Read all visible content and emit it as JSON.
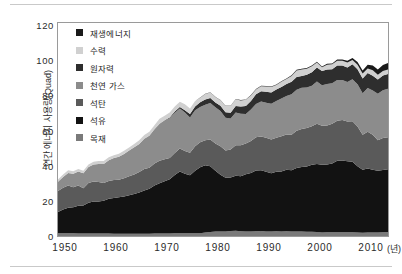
{
  "chart_data": {
    "type": "area",
    "stacked": true,
    "title": "",
    "xlabel": "년",
    "ylabel": "연간 에너지 사용량(Quad)",
    "xlim": [
      1949,
      2014
    ],
    "ylim": [
      0,
      120
    ],
    "yticks": [
      120,
      100,
      80,
      60,
      40,
      20,
      0
    ],
    "xticks": [
      1950,
      1960,
      1970,
      1980,
      1990,
      2000,
      2010
    ],
    "grid": false,
    "legend_position": "inside-top-left",
    "legend_order_top_to_bottom": [
      "재생에너지",
      "수력",
      "원자력",
      "천연 가스",
      "석탄",
      "석유",
      "목재"
    ],
    "stack_order_bottom_to_top": [
      "목재",
      "석유",
      "석탄",
      "천연 가스",
      "원자력",
      "수력",
      "재생에너지"
    ],
    "colors": {
      "재생에너지": "#1a1a1a",
      "수력": "#d0d0d0",
      "원자력": "#2e2e2e",
      "천연 가스": "#8c8c8c",
      "석탄": "#5a5a5a",
      "석유": "#121212",
      "목재": "#7a7a7a"
    },
    "x": [
      1949,
      1950,
      1951,
      1952,
      1953,
      1954,
      1955,
      1956,
      1957,
      1958,
      1959,
      1960,
      1961,
      1962,
      1963,
      1964,
      1965,
      1966,
      1967,
      1968,
      1969,
      1970,
      1971,
      1972,
      1973,
      1974,
      1975,
      1976,
      1977,
      1978,
      1979,
      1980,
      1981,
      1982,
      1983,
      1984,
      1985,
      1986,
      1987,
      1988,
      1989,
      1990,
      1991,
      1992,
      1993,
      1994,
      1995,
      1996,
      1997,
      1998,
      1999,
      2000,
      2001,
      2002,
      2003,
      2004,
      2005,
      2006,
      2007,
      2008,
      2009,
      2010,
      2011,
      2012,
      2013,
      2014
    ],
    "series": [
      {
        "name": "목재",
        "values": [
          1.6,
          1.6,
          1.5,
          1.5,
          1.4,
          1.4,
          1.4,
          1.4,
          1.4,
          1.4,
          1.4,
          1.3,
          1.3,
          1.3,
          1.3,
          1.3,
          1.3,
          1.3,
          1.3,
          1.4,
          1.4,
          1.4,
          1.4,
          1.5,
          1.5,
          1.5,
          1.5,
          1.6,
          1.6,
          2.0,
          2.2,
          2.5,
          2.6,
          2.6,
          2.8,
          2.9,
          2.7,
          2.6,
          2.6,
          2.7,
          2.8,
          2.6,
          2.6,
          2.7,
          2.6,
          2.7,
          2.6,
          2.6,
          2.6,
          2.4,
          2.4,
          2.3,
          2.0,
          2.1,
          2.1,
          2.1,
          2.1,
          2.1,
          2.1,
          2.0,
          1.9,
          2.0,
          2.0,
          2.0,
          2.1,
          2.2
        ]
      },
      {
        "name": "석유",
        "values": [
          11.9,
          13.3,
          14.4,
          14.7,
          15.6,
          15.8,
          17.3,
          18.0,
          18.0,
          18.5,
          19.6,
          20.1,
          20.5,
          21.0,
          21.7,
          22.3,
          23.2,
          24.4,
          25.3,
          27.0,
          28.3,
          29.5,
          30.6,
          32.9,
          34.8,
          33.5,
          32.7,
          35.2,
          37.1,
          37.9,
          37.1,
          34.2,
          31.9,
          30.2,
          30.1,
          31.1,
          30.9,
          32.2,
          32.9,
          34.2,
          34.2,
          33.6,
          32.8,
          33.5,
          33.8,
          34.6,
          34.4,
          35.7,
          36.3,
          36.8,
          37.8,
          38.3,
          38.2,
          38.2,
          38.8,
          40.3,
          40.4,
          40.0,
          39.8,
          37.3,
          35.4,
          36.0,
          35.3,
          34.7,
          35.1,
          35.4
        ]
      },
      {
        "name": "석탄",
        "values": [
          11.9,
          12.3,
          12.6,
          11.3,
          11.4,
          9.7,
          11.2,
          11.3,
          11.0,
          10.0,
          10.0,
          10.1,
          9.9,
          10.2,
          10.7,
          11.1,
          11.6,
          12.0,
          11.9,
          12.4,
          12.7,
          12.3,
          11.9,
          12.4,
          13.0,
          12.9,
          12.7,
          13.7,
          14.1,
          14.0,
          15.0,
          15.4,
          16.0,
          15.3,
          15.9,
          17.1,
          17.5,
          17.3,
          18.0,
          18.8,
          19.1,
          19.2,
          19.0,
          19.1,
          19.8,
          19.9,
          20.1,
          21.0,
          21.4,
          21.7,
          21.6,
          22.6,
          21.9,
          21.9,
          22.3,
          22.5,
          22.8,
          22.4,
          22.7,
          22.4,
          19.7,
          20.8,
          19.7,
          17.3,
          18.0,
          18.0
        ]
      },
      {
        "name": "천연 가스",
        "values": [
          5.1,
          6.0,
          7.0,
          7.5,
          8.0,
          8.5,
          9.0,
          9.6,
          10.2,
          10.7,
          11.7,
          12.4,
          12.9,
          13.7,
          14.4,
          15.3,
          15.8,
          17.0,
          17.9,
          19.2,
          20.7,
          21.8,
          22.5,
          22.7,
          22.5,
          21.7,
          19.9,
          20.3,
          19.9,
          20.0,
          20.7,
          20.4,
          19.9,
          18.5,
          17.4,
          18.5,
          17.8,
          16.7,
          17.7,
          18.6,
          19.7,
          19.7,
          20.1,
          20.7,
          21.3,
          21.7,
          22.7,
          23.1,
          23.2,
          22.8,
          22.9,
          23.8,
          22.8,
          23.5,
          22.8,
          23.0,
          22.6,
          22.2,
          23.7,
          23.8,
          23.4,
          24.6,
          25.0,
          26.1,
          26.9,
          27.4
        ]
      },
      {
        "name": "원자력",
        "values": [
          0.0,
          0.0,
          0.0,
          0.0,
          0.0,
          0.0,
          0.0,
          0.0,
          0.0,
          0.0,
          0.0,
          0.0,
          0.0,
          0.0,
          0.0,
          0.0,
          0.0,
          0.1,
          0.1,
          0.1,
          0.2,
          0.2,
          0.4,
          0.6,
          0.9,
          1.3,
          1.9,
          2.1,
          2.7,
          3.0,
          2.8,
          2.7,
          3.0,
          3.1,
          3.2,
          3.6,
          4.1,
          4.5,
          4.9,
          5.6,
          5.7,
          6.1,
          6.4,
          6.5,
          6.5,
          6.8,
          7.1,
          7.2,
          6.7,
          7.2,
          7.6,
          7.9,
          8.0,
          8.1,
          7.9,
          8.2,
          8.2,
          8.2,
          8.5,
          8.5,
          8.4,
          8.4,
          8.3,
          8.1,
          8.3,
          8.3
        ]
      },
      {
        "name": "수력",
        "values": [
          1.4,
          1.4,
          1.5,
          1.5,
          1.4,
          1.4,
          1.4,
          1.5,
          1.6,
          1.6,
          1.6,
          1.6,
          1.7,
          1.8,
          1.8,
          1.9,
          2.1,
          2.1,
          2.3,
          2.3,
          2.7,
          2.6,
          2.8,
          2.9,
          3.0,
          3.3,
          3.2,
          3.1,
          2.5,
          3.1,
          3.1,
          3.1,
          3.1,
          3.6,
          3.9,
          3.8,
          3.4,
          3.4,
          3.1,
          2.7,
          2.9,
          3.0,
          3.0,
          2.6,
          2.9,
          2.7,
          3.2,
          3.6,
          3.6,
          3.3,
          3.3,
          2.8,
          2.2,
          2.7,
          2.8,
          2.7,
          2.7,
          2.9,
          2.4,
          2.5,
          2.7,
          2.5,
          3.1,
          2.6,
          2.6,
          2.5
        ]
      },
      {
        "name": "재생에너지",
        "values": [
          0.0,
          0.0,
          0.0,
          0.0,
          0.0,
          0.0,
          0.0,
          0.0,
          0.0,
          0.0,
          0.0,
          0.0,
          0.0,
          0.0,
          0.0,
          0.0,
          0.0,
          0.0,
          0.0,
          0.0,
          0.0,
          0.0,
          0.0,
          0.0,
          0.0,
          0.0,
          0.0,
          0.1,
          0.1,
          0.1,
          0.1,
          0.1,
          0.1,
          0.1,
          0.1,
          0.2,
          0.2,
          0.2,
          0.2,
          0.2,
          0.3,
          0.3,
          0.3,
          0.3,
          0.3,
          0.4,
          0.4,
          0.4,
          0.4,
          0.4,
          0.4,
          0.4,
          0.4,
          0.5,
          0.5,
          0.6,
          0.7,
          0.9,
          1.1,
          1.5,
          1.7,
          2.2,
          2.7,
          3.0,
          3.3,
          3.6
        ]
      }
    ],
    "legend": [
      {
        "label": "재생에너지",
        "color": "#1a1a1a"
      },
      {
        "label": "수력",
        "color": "#d0d0d0"
      },
      {
        "label": "원자력",
        "color": "#2e2e2e"
      },
      {
        "label": "천연 가스",
        "color": "#8c8c8c"
      },
      {
        "label": "석탄",
        "color": "#5a5a5a"
      },
      {
        "label": "석유",
        "color": "#121212"
      },
      {
        "label": "목재",
        "color": "#7a7a7a"
      }
    ]
  },
  "axis": {
    "y_title": "연간 에너지 사용량(Quad)",
    "y_ticks": [
      "120",
      "100",
      "80",
      "60",
      "40",
      "20",
      "0"
    ],
    "x_ticks": [
      "1950",
      "1960",
      "1970",
      "1980",
      "1990",
      "2000",
      "2010"
    ],
    "x_unit": "(년)"
  }
}
